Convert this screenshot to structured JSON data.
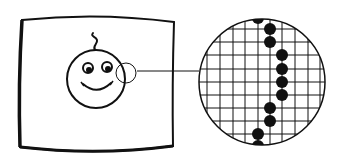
{
  "diagram": {
    "colors": {
      "ink": "#111111",
      "background": "#ffffff"
    },
    "tv_screen": {
      "label": "tv-screen",
      "corners": {
        "top_left": [
          22,
          19
        ],
        "top_right": [
          174,
          21
        ],
        "bottom_right": [
          173,
          147
        ],
        "bottom_left": [
          20,
          147
        ]
      }
    },
    "face": {
      "center": [
        96,
        79
      ],
      "radius": 29,
      "eyes": [
        [
          88,
          68
        ],
        [
          107,
          67
        ]
      ],
      "has_hair_curl": true,
      "has_smile": true
    },
    "magnifier": {
      "center": [
        126,
        73
      ],
      "radius": 10
    },
    "connector_line": {
      "from": [
        137,
        71
      ],
      "to": [
        199,
        71
      ]
    },
    "zoomed_view": {
      "center": [
        262,
        82
      ],
      "radius": 64,
      "grid_spacing": 12.5,
      "pixel_dots": [
        [
          258,
          17
        ],
        [
          270,
          28
        ],
        [
          270,
          42
        ],
        [
          282,
          55
        ],
        [
          282,
          69
        ],
        [
          282,
          82
        ],
        [
          282,
          95
        ],
        [
          270,
          108
        ],
        [
          270,
          121
        ],
        [
          258,
          133
        ],
        [
          258,
          146
        ]
      ],
      "dot_radius": 6
    }
  }
}
